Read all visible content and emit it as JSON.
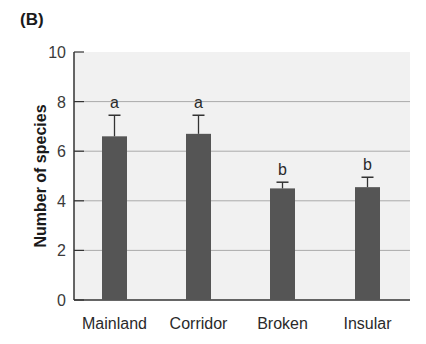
{
  "figure": {
    "panel_label": "(B)",
    "ylabel": "Number of species"
  },
  "chart_data": {
    "type": "bar",
    "title": "",
    "panel": "(B)",
    "xlabel": "",
    "ylabel": "Number of species",
    "categories": [
      "Mainland",
      "Corridor",
      "Broken",
      "Insular"
    ],
    "values": [
      6.6,
      6.7,
      4.5,
      4.55
    ],
    "error_upper": [
      7.45,
      7.45,
      4.75,
      4.95
    ],
    "significance_letters": [
      "a",
      "a",
      "b",
      "b"
    ],
    "ylim": [
      0,
      10
    ],
    "yticks": [
      0,
      2,
      4,
      6,
      8,
      10
    ],
    "grid": true,
    "legend": null,
    "colors": {
      "bar": "#555555",
      "plot_background": "#f1f1f1",
      "grid": "#aaaaaa",
      "axis": "#333333"
    }
  }
}
